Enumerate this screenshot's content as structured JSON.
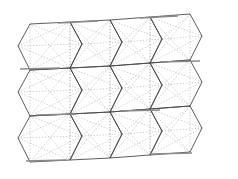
{
  "figure": {
    "background_color": "#ffffff",
    "width": 238,
    "height": 179
  },
  "style": {
    "edge_color": "#4a4a4a",
    "edge_width": 0.9,
    "band_color": "#8a8a8a",
    "band_width": 1.6,
    "diagonal_color": "#b0b0b0",
    "diagonal_width": 0.6,
    "diagonal_dash": "1.4,1.6"
  },
  "mesh": {
    "rows": 4,
    "cols": 4,
    "description": "Grid of deformed quadrilateral cells; each cell carries two light dotted diagonals forming an X.",
    "nodes": [
      [
        [
          18,
          46
        ],
        [
          53,
          30
        ],
        [
          93,
          25
        ],
        [
          131,
          20
        ],
        [
          169,
          15
        ],
        [
          205,
          10
        ]
      ],
      [
        [
          14,
          75
        ],
        [
          57,
          62
        ],
        [
          93,
          57
        ],
        [
          128,
          55
        ],
        [
          168,
          48
        ],
        [
          206,
          44
        ]
      ],
      [
        [
          30,
          72
        ],
        [
          62,
          66
        ],
        [
          100,
          62
        ],
        [
          140,
          58
        ],
        [
          176,
          52
        ],
        [
          214,
          46
        ]
      ],
      [
        [
          17,
          108
        ],
        [
          55,
          99
        ],
        [
          95,
          93
        ],
        [
          135,
          88
        ],
        [
          172,
          82
        ],
        [
          210,
          78
        ]
      ],
      [
        [
          33,
          104
        ],
        [
          66,
          100
        ],
        [
          104,
          96
        ],
        [
          144,
          92
        ],
        [
          180,
          86
        ],
        [
          218,
          80
        ]
      ],
      [
        [
          15,
          140
        ],
        [
          52,
          134
        ],
        [
          92,
          128
        ],
        [
          132,
          122
        ],
        [
          170,
          116
        ],
        [
          208,
          112
        ]
      ],
      [
        [
          30,
          136
        ],
        [
          63,
          132
        ],
        [
          101,
          128
        ],
        [
          141,
          124
        ],
        [
          178,
          118
        ],
        [
          216,
          114
        ]
      ],
      [
        [
          28,
          172
        ],
        [
          66,
          166
        ],
        [
          106,
          160
        ],
        [
          146,
          154
        ],
        [
          184,
          148
        ],
        [
          220,
          144
        ]
      ]
    ],
    "cells": [
      {
        "id": "r1c1",
        "points": "18,46 30,24 70,22 82,44 70,68 30,70"
      },
      {
        "id": "r1c2",
        "points": "70,22 110,20 122,42 110,66 70,68 82,44"
      },
      {
        "id": "r1c3",
        "points": "110,20 150,17 162,39 150,63 110,66 122,42"
      },
      {
        "id": "r1c4",
        "points": "150,17 190,14 202,36 190,60 150,63 162,39"
      },
      {
        "id": "r2c1",
        "points": "30,70 70,68 82,90 70,114 30,116 18,92"
      },
      {
        "id": "r2c2",
        "points": "70,68 110,66 122,88 110,112 70,114 82,90"
      },
      {
        "id": "r2c3",
        "points": "110,66 150,63 162,85 150,109 110,112 122,88"
      },
      {
        "id": "r2c4",
        "points": "150,63 190,60 202,82 190,106 150,109 162,85"
      },
      {
        "id": "r3c1",
        "points": "30,116 70,114 82,136 70,160 30,162 18,138"
      },
      {
        "id": "r3c2",
        "points": "70,114 110,112 122,134 110,158 70,160 82,136"
      },
      {
        "id": "r3c3",
        "points": "110,112 150,109 162,131 150,155 110,158 122,134"
      },
      {
        "id": "r3c4",
        "points": "150,109 190,106 202,128 190,152 150,155 162,131"
      }
    ],
    "bands": [
      {
        "id": "band-top-1",
        "x1": 58,
        "y1": 23,
        "x2": 98,
        "y2": 21
      },
      {
        "id": "band-top-2",
        "x1": 140,
        "y1": 18,
        "x2": 178,
        "y2": 16
      },
      {
        "id": "band-mid-1",
        "x1": 20,
        "y1": 69,
        "x2": 60,
        "y2": 68
      },
      {
        "id": "band-mid-2",
        "x1": 160,
        "y1": 62,
        "x2": 200,
        "y2": 61
      },
      {
        "id": "band-mid-3",
        "x1": 36,
        "y1": 115,
        "x2": 76,
        "y2": 114
      },
      {
        "id": "band-mid-4",
        "x1": 120,
        "y1": 111,
        "x2": 160,
        "y2": 110
      },
      {
        "id": "band-low-1",
        "x1": 26,
        "y1": 161,
        "x2": 66,
        "y2": 160
      },
      {
        "id": "band-low-2",
        "x1": 152,
        "y1": 154,
        "x2": 192,
        "y2": 153
      }
    ]
  }
}
